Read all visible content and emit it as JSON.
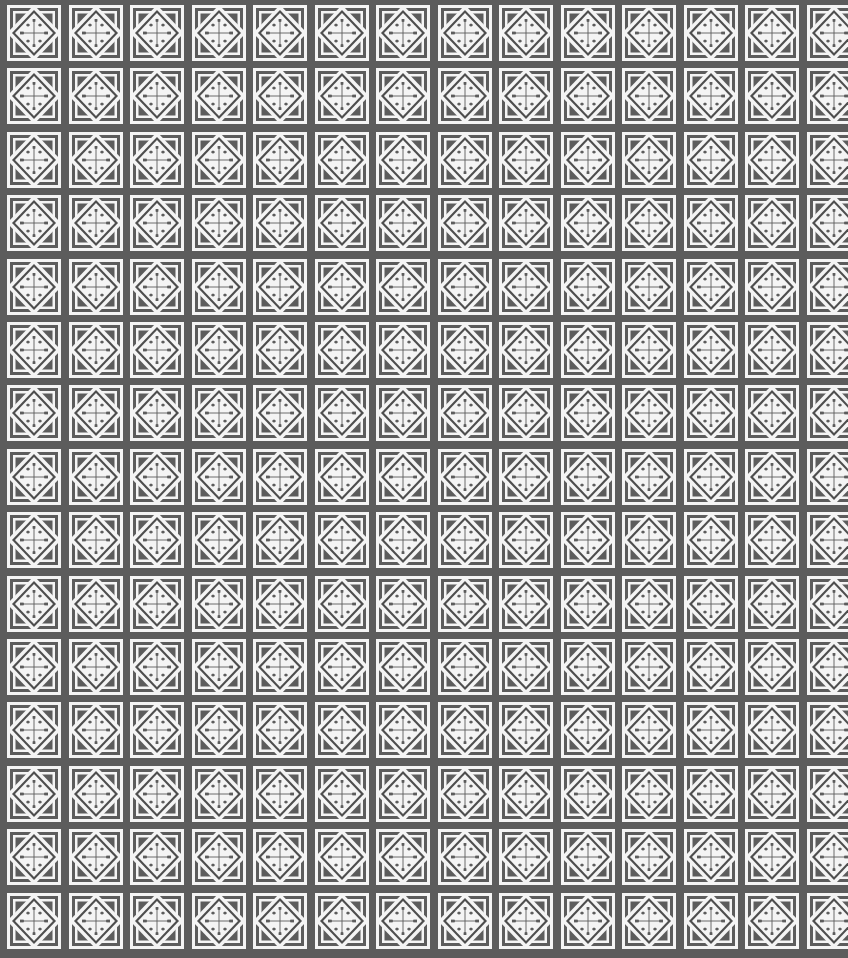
{
  "pattern": {
    "description": "Repeating geometric tile pattern of white diamonds with four-lobed cross motifs on dark gray",
    "columns": 14,
    "rows": 15,
    "pitch_x": 61.5,
    "pitch_y": 63.4,
    "offset_x": 9,
    "offset_y": 7,
    "tile_icon": "diamond-cross-tile-icon",
    "colors": {
      "background": "#5c5c5c",
      "foreground": "#f4f4f4",
      "line": "#4a4a4a"
    }
  }
}
